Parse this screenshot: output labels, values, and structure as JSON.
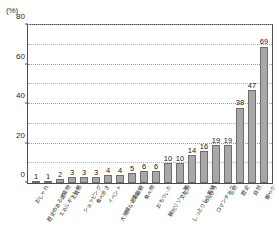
{
  "chart_data": {
    "type": "bar",
    "title": "",
    "subtitle": "",
    "xlabel": "",
    "ylabel": "",
    "unit_label": "(%)",
    "ylim": [
      0,
      80
    ],
    "ytick_labels": [
      "0",
      "20",
      "40",
      "60",
      "80"
    ],
    "ytick_values": [
      0,
      20,
      40,
      60,
      80
    ],
    "gridline_values": [
      10,
      20,
      30,
      40,
      50,
      60,
      70,
      80
    ],
    "grid": true,
    "legend": "none",
    "categories": [
      "おしゃれ",
      "歴史のある建築物",
      "エネルギッシュ",
      "上質感",
      "ショッピング",
      "食べ歩き",
      "イベント",
      "大規模な遊ぶ施設",
      "楽しい",
      "食べ物",
      "おちついた",
      "観光リゾート地",
      "文化的",
      "しっとりした風情",
      "のんびり",
      "ロマンチック",
      "伝統",
      "歴史",
      "自然",
      "賑やか"
    ],
    "values": [
      1,
      1,
      2,
      3,
      3,
      3,
      4,
      4,
      5,
      6,
      6,
      10,
      10,
      14,
      16,
      19,
      19,
      38,
      47,
      69
    ],
    "data_labels": [
      "1",
      "1",
      "2",
      "3",
      "3",
      "3",
      "4",
      "4",
      "5",
      "6",
      "6",
      "10",
      "10",
      "14",
      "16",
      "19",
      "19",
      "38",
      "47",
      "69"
    ],
    "colors": {
      "bar_fill": "#a8a8a8",
      "bar_border": "#6e6e6e",
      "gridline": "#b5b5b5",
      "axis": "#4d4d4d",
      "text": "#1a1a1a",
      "background": "#ffffff"
    }
  }
}
